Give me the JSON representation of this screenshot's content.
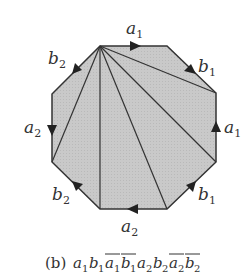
{
  "figure": {
    "caption_prefix": "(b)",
    "caption_word": [
      {
        "letter": "a",
        "sub": "1",
        "bar": false
      },
      {
        "letter": "b",
        "sub": "1",
        "bar": false
      },
      {
        "letter": "a",
        "sub": "1",
        "bar": true
      },
      {
        "letter": "b",
        "sub": "1",
        "bar": true
      },
      {
        "letter": "a",
        "sub": "2",
        "bar": false
      },
      {
        "letter": "b",
        "sub": "2",
        "bar": false
      },
      {
        "letter": "a",
        "sub": "2",
        "bar": true
      },
      {
        "letter": "b",
        "sub": "2",
        "bar": true
      }
    ],
    "colors": {
      "fill": "#c8c8c8",
      "stroke": "#333333"
    },
    "edge_labels": {
      "top": {
        "letter": "a",
        "sub": "1"
      },
      "top_right": {
        "letter": "b",
        "sub": "1"
      },
      "right": {
        "letter": "a",
        "sub": "1"
      },
      "bottom_right": {
        "letter": "b",
        "sub": "1"
      },
      "bottom": {
        "letter": "a",
        "sub": "2"
      },
      "bottom_left": {
        "letter": "b",
        "sub": "2"
      },
      "left": {
        "letter": "a",
        "sub": "2"
      },
      "top_left": {
        "letter": "b",
        "sub": "2"
      }
    }
  }
}
